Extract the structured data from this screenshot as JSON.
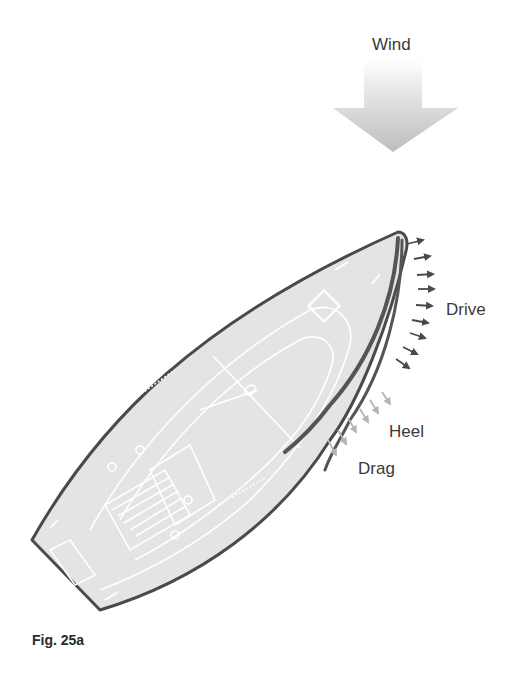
{
  "diagram": {
    "labels": {
      "wind": "Wind",
      "drive": "Drive",
      "heel": "Heel",
      "drag": "Drag"
    },
    "caption": "Fig. 25a",
    "colors": {
      "background": "#ffffff",
      "hull_fill": "#e4e4e4",
      "hull_outline": "#4a4a4a",
      "deck_lines": "#ffffff",
      "sail": "#555555",
      "drive_arrows": "#4a4a4a",
      "heel_drag_arrows": "#b5b5b5",
      "wind_arrow_top": "#ffffff",
      "wind_arrow_bottom": "#c8c8c8",
      "label_text": "#3a3a3a"
    },
    "elements": [
      {
        "name": "wind-arrow",
        "description": "large downward gradient arrow"
      },
      {
        "name": "boat-hull",
        "description": "top-down sailboat hull, bow to upper right"
      },
      {
        "name": "sail",
        "description": "curved sail from bow along the leeward side"
      },
      {
        "name": "drive-arrows",
        "count": 9
      },
      {
        "name": "heel-drag-arrows",
        "count": 6
      }
    ]
  }
}
